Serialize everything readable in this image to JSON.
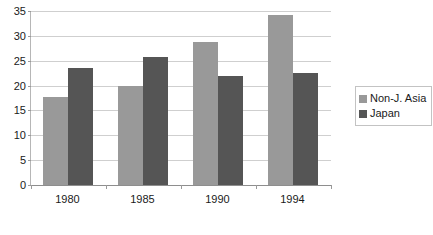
{
  "chart_data": {
    "type": "bar",
    "title": "",
    "xlabel": "",
    "ylabel": "",
    "categories": [
      "1980",
      "1985",
      "1990",
      "1994"
    ],
    "series": [
      {
        "name": "Non-J. Asia",
        "color": "#999999",
        "values": [
          17.8,
          20.0,
          28.7,
          34.2
        ]
      },
      {
        "name": "Japan",
        "color": "#555555",
        "values": [
          23.6,
          25.7,
          22.0,
          22.6
        ]
      }
    ],
    "ylim": [
      0,
      35
    ],
    "ytick_step": 5,
    "yticks": [
      "35",
      "30",
      "25",
      "20",
      "15",
      "10",
      "5",
      "0"
    ],
    "grid": true,
    "legend_position": "right"
  },
  "legend": {
    "entries": [
      {
        "label": "Non-J. Asia"
      },
      {
        "label": "Japan"
      }
    ]
  },
  "colors": {
    "series_light": "#999999",
    "series_dark": "#555555",
    "gridline": "#cfcfcf",
    "axis": "#8e8e8e",
    "text": "#1a1a1a",
    "background": "#ffffff"
  }
}
